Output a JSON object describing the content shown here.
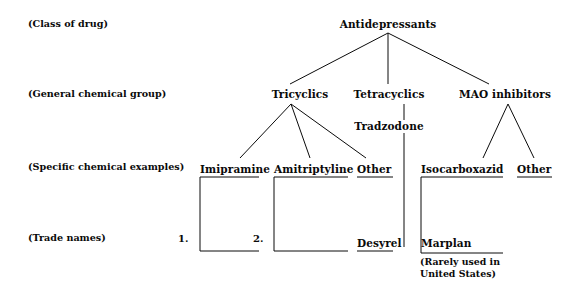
{
  "diagram": {
    "ink_color": "#0a0a0a",
    "background_color": "#ffffff"
  },
  "row_labels": [
    {
      "id": "class-of-drug",
      "text": "(Class of drug)"
    },
    {
      "id": "general-chemical-group",
      "text": "(General chemical group)"
    },
    {
      "id": "specific-chemical-examples",
      "text": "(Specific chemical examples)"
    },
    {
      "id": "trade-names",
      "text": "(Trade names)"
    }
  ],
  "nodes": {
    "root": "Antidepressants",
    "groups": {
      "tricyclics": "Tricyclics",
      "tetracyclics": "Tetracyclics",
      "mao_inhibitors": "MAO inhibitors"
    },
    "tetracyclic_example": "Tradzodone",
    "examples": {
      "imipramine": "Imipramine",
      "amitriptyline": "Amitriptyline",
      "tricyclic_other": "Other",
      "isocarboxazid": "Isocarboxazid",
      "mao_other": "Other"
    },
    "trade_names": {
      "desyrel": "Desyrel",
      "marplan": "Marplan"
    }
  },
  "numbering": {
    "first": "1.",
    "second": "2."
  },
  "annotations": {
    "marplan_note_line1": "(Rarely used in",
    "marplan_note_line2": "United States)"
  }
}
